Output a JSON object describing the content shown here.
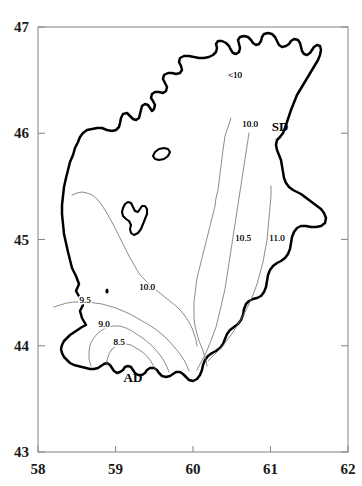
{
  "figure": {
    "kind": "contour-map",
    "frame": {
      "left": 38,
      "right": 348,
      "top": 27,
      "bottom": 452
    }
  },
  "axes": {
    "x": {
      "label": "",
      "min": 58,
      "max": 62,
      "ticks": [
        {
          "value": 58,
          "label": "58",
          "px": 38
        },
        {
          "value": 59,
          "label": "59",
          "px": 115.5
        },
        {
          "value": 60,
          "label": "60",
          "px": 193
        },
        {
          "value": 61,
          "label": "61",
          "px": 270.5
        },
        {
          "value": 62,
          "label": "62",
          "px": 348
        }
      ]
    },
    "y": {
      "label": "",
      "min": 43,
      "max": 47,
      "ticks": [
        {
          "value": 47,
          "label": "47",
          "px": 27
        },
        {
          "value": 46,
          "label": "46",
          "px": 133.25
        },
        {
          "value": 45,
          "label": "45",
          "px": 239.5
        },
        {
          "value": 44,
          "label": "44",
          "px": 345.75
        },
        {
          "value": 43,
          "label": "43",
          "px": 452
        }
      ]
    }
  },
  "chart_data": {
    "type": "contour-map",
    "title": "",
    "xlabel": "",
    "ylabel": "",
    "xlim": [
      58,
      62
    ],
    "ylim": [
      43,
      47
    ],
    "grid": false,
    "legend": "none",
    "contour_levels": [
      8.5,
      9.0,
      9.5,
      10.0,
      10.5,
      11.0
    ],
    "contour_labels": [
      {
        "text": "<10",
        "value": null,
        "x_px": 235,
        "y_px": 78
      },
      {
        "text": "10.0",
        "value": 10.0,
        "x_px": 250,
        "y_px": 127
      },
      {
        "text": "10.5",
        "value": 10.5,
        "x_px": 243,
        "y_px": 241
      },
      {
        "text": "11.0",
        "value": 11.0,
        "x_px": 277,
        "y_px": 241
      },
      {
        "text": "10.0",
        "value": 10.0,
        "x_px": 147,
        "y_px": 290
      },
      {
        "text": "9.5",
        "value": 9.5,
        "x_px": 85,
        "y_px": 303
      },
      {
        "text": "9.0",
        "value": 9.0,
        "x_px": 104,
        "y_px": 327
      },
      {
        "text": "8.5",
        "value": 8.5,
        "x_px": 119,
        "y_px": 345
      }
    ],
    "stations": [
      {
        "name": "SD",
        "label": "SD",
        "x_px": 280,
        "y_px": 131,
        "marker": false
      },
      {
        "name": "AD",
        "label": "AD",
        "x_px": 133,
        "y_px": 382,
        "marker": false
      },
      {
        "name": "",
        "label": "",
        "x_px": 107,
        "y_px": 291,
        "marker": true
      }
    ]
  },
  "geometry": {
    "coastline": "M 86,325 L 82,318 L 80,311 L 83,305 L 80,298 L 76,291 L 79,284 L 76,276 L 72,268 L 70,260 L 68,252 L 66,243 L 64,234 L 63,224 L 62,214 L 62,205 L 63,196 L 64,187 L 66,178 L 68,170 L 70,162 L 73,155 L 75,148 L 78,142 L 80,137 L 83,133 L 87,130 L 92,129 L 97,128 L 102,128 L 107,130 L 112,131 L 116,130 L 119,127 L 120,123 L 121,118 L 123,114 L 127,113 L 130,116 L 133,119 L 136,120 L 139,118 L 140,114 L 141,110 L 142,106 L 145,104 L 148,105 L 150,108 L 152,111 L 154,109 L 155,105 L 153,101 L 151,98 L 152,94 L 155,92 L 159,92 L 163,93 L 166,91 L 167,87 L 165,83 L 163,79 L 164,75 L 168,73 L 172,73 L 176,74 L 180,73 L 182,70 L 181,66 L 179,62 L 180,58 L 184,56 L 189,56 L 194,57 L 199,58 L 204,58 L 209,57 L 213,55 L 216,52 L 217,48 L 216,44 L 218,41 L 222,41 L 226,43 L 229,46 L 231,50 L 233,53 L 236,54 L 239,52 L 240,48 L 239,44 L 238,40 L 240,37 L 244,36 L 248,37 L 251,40 L 253,43 L 256,45 L 259,44 L 261,41 L 262,37 L 264,34 L 268,33 L 272,34 L 275,37 L 277,41 L 279,45 L 282,47 L 286,46 L 289,44 L 291,41 L 294,39 L 298,40 L 300,43 L 301,47 L 302,51 L 304,54 L 307,55 L 310,53 L 312,50 L 314,47 L 317,45 L 320,46 L 321,50 L 320,55 L 318,60 L 315,65 L 312,70 L 309,75 L 306,80 L 303,85 L 300,90 L 297,95 L 295,100 L 293,105 L 291,110 L 289,116 L 287,122 L 285,128 L 283,133 L 280,137 L 277,140 L 276,145 L 277,150 L 279,155 L 281,160 L 282,166 L 283,172 L 284,178 L 286,183 L 289,187 L 293,190 L 297,192 L 301,194 L 305,197 L 309,200 L 313,203 L 317,206 L 321,209 L 324,213 L 326,218 L 325,223 L 321,226 L 316,227 L 311,227 L 306,226 L 301,226 L 297,228 L 294,232 L 292,237 L 291,243 L 290,249 L 288,254 L 285,258 L 281,261 L 277,263 L 273,266 L 270,270 L 268,275 L 267,281 L 266,287 L 264,292 L 261,296 L 257,298 L 253,299 L 249,301 L 246,304 L 244,309 L 243,315 L 241,320 L 238,324 L 234,327 L 230,330 L 227,334 L 225,339 L 223,344 L 220,348 L 216,351 L 212,353 L 208,356 L 205,360 L 203,365 L 202,370 L 200,375 L 197,379 L 193,381 L 189,380 L 186,377 L 183,374 L 180,372 L 176,372 L 173,374 L 170,376 L 166,377 L 162,376 L 159,373 L 157,370 L 154,368 L 150,368 L 147,370 L 145,373 L 142,375 L 138,375 L 135,373 L 133,370 L 131,367 L 128,366 L 125,367 L 123,370 L 120,372 L 117,373 L 114,371 L 112,368 L 110,365 L 107,363 L 104,364 L 101,366 L 98,368 L 94,369 L 90,369 L 86,368 L 82,367 L 78,366 L 74,365 L 70,363 L 67,360 L 64,357 L 62,353 L 61,349 L 62,345 L 64,341 L 67,338 L 70,335 L 73,333 L 76,331 L 79,329 L 82,327 L 86,325 Z",
    "lakes": [
      "M 155,152 L 159,149 L 164,148 L 168,149 L 170,152 L 168,156 L 164,159 L 159,160 L 155,159 L 153,156 L 155,152 Z",
      "M 123,208 L 125,204 L 128,202 L 131,203 L 133,207 L 135,211 L 138,212 L 140,209 L 142,206 L 145,206 L 147,209 L 147,214 L 145,219 L 143,224 L 141,229 L 138,233 L 134,235 L 131,233 L 130,229 L 131,225 L 129,221 L 126,219 L 123,216 L 122,212 L 123,208 Z"
    ],
    "contours": [
      {
        "level": 11.0,
        "d": "M 271,186 L 271,196 L 270,207 L 269,218 L 268,229 L 267,240 L 265,251 L 263,262 L 260,273 L 257,284 L 253,295 L 248,306 L 243,316 L 237,326 L 231,335 L 225,343 L 219,350 L 213,356 L 208,361"
      },
      {
        "level": 10.5,
        "d": "M 249,133 L 247,146 L 245,159 L 243,172 L 241,185 L 239,198 L 237,211 L 235,224 L 233,237 L 231,250 L 229,263 L 227,276 L 225,289 L 222,302 L 219,315 L 216,327 L 212,338 L 208,348 L 204,357 L 200,364 L 197,370"
      },
      {
        "level": 10.0,
        "d": "M 231,118 L 229,124 L 227,130 L 225,136 L 224,143 L 223,150 L 222,158 L 221,166 L 220,174 L 219,182 L 218,190 L 216,198 L 215,206 L 213,214 L 211,222 L 209,230 L 207,238 L 205,246 L 203,254 L 201,262 L 199,270 L 197,278 L 196,286 L 195,294 L 194,302 L 194,310 L 194,318 L 195,326 L 197,334 L 199,341 L 202,348 L 204,354 L 206,360 L 207,366"
      },
      {
        "level": 10.0,
        "d": "M 72,195 L 77,193 L 82,192 L 87,193 L 92,195 L 97,199 L 101,204 L 105,210 L 109,217 L 113,224 L 117,232 L 121,240 L 125,248 L 129,256 L 133,263 L 137,270 L 141,276 L 146,281 L 151,286 L 156,290 L 161,294 L 166,298 L 171,302 L 176,306 L 181,311 L 185,316 L 189,322 L 192,328 L 194,334 L 196,340 L 197,346"
      },
      {
        "level": 9.5,
        "d": "M 54,307 L 60,305 L 67,303 L 74,302 L 81,302 L 88,302 L 95,303 L 102,304 L 109,306 L 116,308 L 123,311 L 130,314 L 137,318 L 144,322 L 151,326 L 158,331 L 164,336 L 170,342 L 175,348 L 180,354 L 184,360 L 187,366 L 189,371"
      },
      {
        "level": 9.0,
        "d": "M 91,366 L 89,359 L 89,352 L 90,345 L 93,339 L 97,334 L 102,330 L 108,327 L 114,326 L 120,326 L 126,328 L 132,331 L 138,335 L 144,339 L 150,344 L 155,349 L 160,355 L 164,361 L 167,367 L 169,372"
      },
      {
        "level": 8.5,
        "d": "M 107,366 L 107,360 L 109,354 L 112,349 L 116,346 L 121,344 L 126,344 L 131,345 L 136,348 L 141,351 L 146,355 L 150,360 L 153,365 L 156,370"
      }
    ]
  }
}
